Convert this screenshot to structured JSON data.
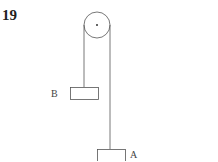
{
  "problem_number": "19",
  "labels": {
    "block_b": "B",
    "block_a": "A"
  },
  "colors": {
    "stroke": "#555555",
    "background": "#ffffff"
  }
}
